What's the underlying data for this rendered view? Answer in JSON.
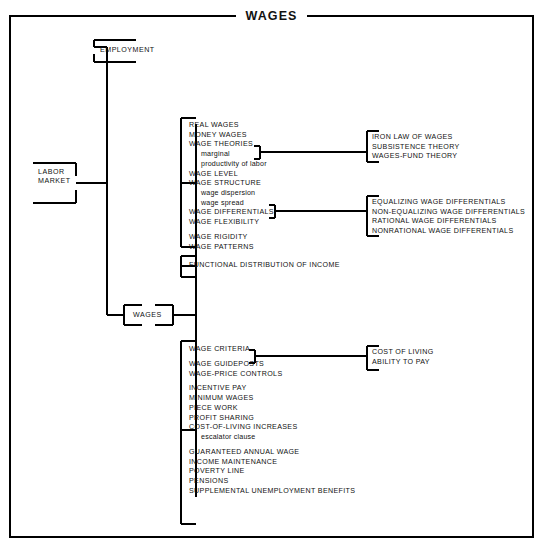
{
  "title": "WAGES",
  "diagram": {
    "type": "tree-outline",
    "root": {
      "label": "LABOR MARKET",
      "lines": [
        "LABOR",
        "MARKET"
      ]
    },
    "branches": [
      {
        "name": "employment",
        "label": "EMPLOYMENT"
      },
      {
        "name": "wages",
        "label": "WAGES"
      }
    ],
    "groups": [
      {
        "name": "wage-concepts",
        "items": [
          {
            "text": "REAL WAGES",
            "level": 0,
            "gap": false
          },
          {
            "text": "MONEY WAGES",
            "level": 0,
            "gap": false
          },
          {
            "text": "WAGE THEORIES",
            "level": 0,
            "gap": false,
            "link": "wage-theories"
          },
          {
            "text": "marginal",
            "level": 1,
            "gap": false
          },
          {
            "text": "productivity of labor",
            "level": 1,
            "gap": false
          },
          {
            "text": "WAGE LEVEL",
            "level": 0,
            "gap": false
          },
          {
            "text": "WAGE STRUCTURE",
            "level": 0,
            "gap": false
          },
          {
            "text": "wage dispersion",
            "level": 1,
            "gap": false
          },
          {
            "text": "wage spread",
            "level": 1,
            "gap": false
          },
          {
            "text": "WAGE DIFFERENTIALS",
            "level": 0,
            "gap": false,
            "link": "wage-differentials"
          },
          {
            "text": "WAGE FLEXIBILITY",
            "level": 0,
            "gap": false
          },
          {
            "text": "WAGE RIGIDITY",
            "level": 0,
            "gap": true
          },
          {
            "text": "WAGE PATTERNS",
            "level": 0,
            "gap": false
          }
        ]
      },
      {
        "name": "functional-distribution",
        "items": [
          {
            "text": "FUNCTIONAL DISTRIBUTION OF INCOME",
            "level": 0,
            "gap": false
          }
        ]
      },
      {
        "name": "wage-policy",
        "items": [
          {
            "text": "WAGE CRITERIA",
            "level": 0,
            "gap": false,
            "link": "wage-criteria"
          },
          {
            "text": "WAGE GUIDEPOSTS",
            "level": 0,
            "gap": true
          },
          {
            "text": "WAGE-PRICE CONTROLS",
            "level": 0,
            "gap": false
          },
          {
            "text": "INCENTIVE PAY",
            "level": 0,
            "gap": true
          },
          {
            "text": "MINIMUM WAGES",
            "level": 0,
            "gap": false
          },
          {
            "text": "PIECE WORK",
            "level": 0,
            "gap": false
          },
          {
            "text": "PROFIT SHARING",
            "level": 0,
            "gap": false
          },
          {
            "text": "COST-OF-LIVING INCREASES",
            "level": 0,
            "gap": false
          },
          {
            "text": "escalator clause",
            "level": 1,
            "gap": false
          },
          {
            "text": "GUARANTEED ANNUAL WAGE",
            "level": 0,
            "gap": true
          },
          {
            "text": "INCOME MAINTENANCE",
            "level": 0,
            "gap": false
          },
          {
            "text": "POVERTY LINE",
            "level": 0,
            "gap": false
          },
          {
            "text": "PENSIONS",
            "level": 0,
            "gap": false
          },
          {
            "text": "SUPPLEMENTAL UNEMPLOYMENT BENEFITS",
            "level": 0,
            "gap": false
          }
        ]
      }
    ],
    "leaf_groups": [
      {
        "name": "wage-theories",
        "items": [
          {
            "text": "IRON LAW OF WAGES"
          },
          {
            "text": "SUBSISTENCE THEORY"
          },
          {
            "text": "WAGES-FUND THEORY"
          }
        ]
      },
      {
        "name": "wage-differentials",
        "items": [
          {
            "text": "EQUALIZING WAGE DIFFERENTIALS"
          },
          {
            "text": "NON-EQUALIZING WAGE DIFFERENTIALS"
          },
          {
            "text": "RATIONAL WAGE DIFFERENTIALS"
          },
          {
            "text": "NONRATIONAL WAGE DIFFERENTIALS"
          }
        ]
      },
      {
        "name": "wage-criteria",
        "items": [
          {
            "text": "COST OF LIVING"
          },
          {
            "text": "ABILITY TO PAY"
          }
        ]
      }
    ],
    "colors": {
      "ink": "#111111",
      "background": "#ffffff",
      "rule": "#000000"
    }
  }
}
